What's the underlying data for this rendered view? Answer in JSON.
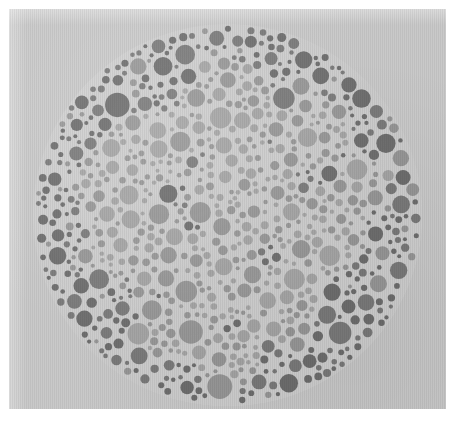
{
  "image": {
    "kind": "ishihara-color-vision-test-plate",
    "title": "Ishihara pseudoisochromatic test plate",
    "description": "Grayscale scan of a circular Ishihara color-vision test plate composed of densely packed dots of varying diameter in two gray tones on a light gray paper background.",
    "orientation": "portrait",
    "width_px": 461,
    "height_px": 426
  },
  "colors": {
    "scan_margin": "#ffffff",
    "paper_background": "#c9c9c9",
    "plate_field": "#d2d2d2",
    "dot_dark": "#6f6f6f",
    "dot_mid": "#7c7c7c",
    "dot_light": "#9a9a9a",
    "dot_pale": "#a8a8a8"
  },
  "plate": {
    "shape": "circle",
    "center_x": 227,
    "center_y": 215,
    "radius_x": 194,
    "radius_y": 191,
    "dot_count_approx": 760,
    "dot_min_radius": 2,
    "dot_max_radius": 13,
    "tone_groups": [
      {
        "name": "dark-dots",
        "color": "#6f6f6f",
        "role": "background-mosaic"
      },
      {
        "name": "mid-dots",
        "color": "#7c7c7c",
        "role": "background-mosaic"
      },
      {
        "name": "light-dots",
        "color": "#9a9a9a",
        "role": "hidden-figure"
      },
      {
        "name": "pale-dots",
        "color": "#a8a8a8",
        "role": "hidden-figure"
      }
    ]
  },
  "margins": {
    "left_px": 9,
    "right_px": 15,
    "top_px": 9,
    "bottom_px": 17
  }
}
